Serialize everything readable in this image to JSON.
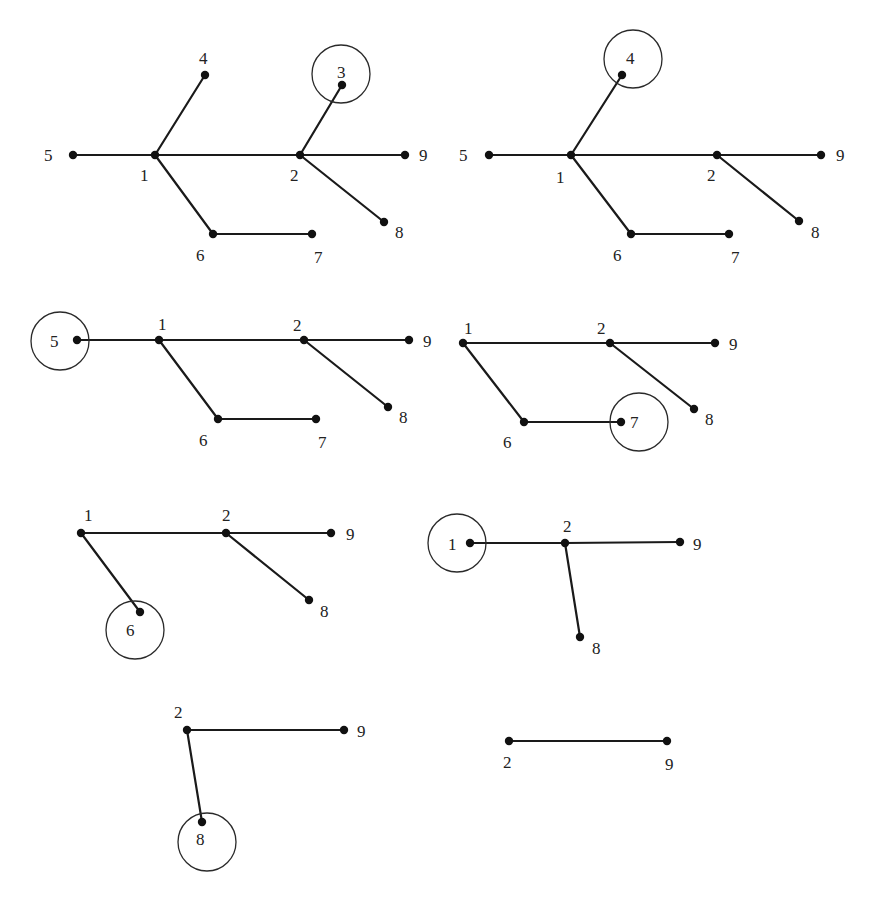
{
  "colors": {
    "background": "#ffffff",
    "edge": "#1a1a1a",
    "node": "#111111",
    "circle": "#2a2a2a",
    "label": "#222222"
  },
  "panels": [
    {
      "id": "step-1",
      "removed_leaf": "3",
      "nodes": [
        {
          "id": "5",
          "x": 73,
          "y": 155,
          "lx": 44,
          "ly": 161
        },
        {
          "id": "1",
          "x": 155,
          "y": 155,
          "lx": 140,
          "ly": 181
        },
        {
          "id": "4",
          "x": 205,
          "y": 75,
          "lx": 199,
          "ly": 64
        },
        {
          "id": "2",
          "x": 300,
          "y": 155,
          "lx": 290,
          "ly": 181
        },
        {
          "id": "3",
          "x": 342,
          "y": 85,
          "lx": 337,
          "ly": 78
        },
        {
          "id": "9",
          "x": 405,
          "y": 155,
          "lx": 419,
          "ly": 161
        },
        {
          "id": "8",
          "x": 384,
          "y": 222,
          "lx": 395,
          "ly": 238
        },
        {
          "id": "6",
          "x": 213,
          "y": 234,
          "lx": 196,
          "ly": 261
        },
        {
          "id": "7",
          "x": 312,
          "y": 234,
          "lx": 314,
          "ly": 263
        }
      ],
      "edges": [
        [
          "5",
          "1"
        ],
        [
          "1",
          "4"
        ],
        [
          "1",
          "2"
        ],
        [
          "2",
          "3"
        ],
        [
          "2",
          "9"
        ],
        [
          "2",
          "8"
        ],
        [
          "1",
          "6"
        ],
        [
          "6",
          "7"
        ]
      ],
      "circle": {
        "cx": 341,
        "cy": 74,
        "r": 29
      }
    },
    {
      "id": "step-2",
      "removed_leaf": "4",
      "nodes": [
        {
          "id": "5",
          "x": 489,
          "y": 155,
          "lx": 459,
          "ly": 161
        },
        {
          "id": "1",
          "x": 571,
          "y": 155,
          "lx": 556,
          "ly": 183
        },
        {
          "id": "4",
          "x": 622,
          "y": 75,
          "lx": 626,
          "ly": 64
        },
        {
          "id": "2",
          "x": 717,
          "y": 155,
          "lx": 707,
          "ly": 181
        },
        {
          "id": "9",
          "x": 821,
          "y": 155,
          "lx": 836,
          "ly": 161
        },
        {
          "id": "8",
          "x": 799,
          "y": 221,
          "lx": 811,
          "ly": 238
        },
        {
          "id": "6",
          "x": 631,
          "y": 234,
          "lx": 613,
          "ly": 261
        },
        {
          "id": "7",
          "x": 729,
          "y": 234,
          "lx": 731,
          "ly": 263
        }
      ],
      "edges": [
        [
          "5",
          "1"
        ],
        [
          "1",
          "4"
        ],
        [
          "1",
          "2"
        ],
        [
          "2",
          "9"
        ],
        [
          "2",
          "8"
        ],
        [
          "1",
          "6"
        ],
        [
          "6",
          "7"
        ]
      ],
      "circle": {
        "cx": 633,
        "cy": 59,
        "r": 29
      }
    },
    {
      "id": "step-3",
      "removed_leaf": "5",
      "nodes": [
        {
          "id": "5",
          "x": 77,
          "y": 340,
          "lx": 50,
          "ly": 347
        },
        {
          "id": "1",
          "x": 159,
          "y": 340,
          "lx": 158,
          "ly": 330
        },
        {
          "id": "2",
          "x": 304,
          "y": 340,
          "lx": 293,
          "ly": 331
        },
        {
          "id": "9",
          "x": 409,
          "y": 340,
          "lx": 423,
          "ly": 347
        },
        {
          "id": "8",
          "x": 388,
          "y": 407,
          "lx": 399,
          "ly": 423
        },
        {
          "id": "6",
          "x": 218,
          "y": 419,
          "lx": 199,
          "ly": 446
        },
        {
          "id": "7",
          "x": 316,
          "y": 419,
          "lx": 318,
          "ly": 448
        }
      ],
      "edges": [
        [
          "5",
          "1"
        ],
        [
          "1",
          "2"
        ],
        [
          "2",
          "9"
        ],
        [
          "2",
          "8"
        ],
        [
          "1",
          "6"
        ],
        [
          "6",
          "7"
        ]
      ],
      "circle": {
        "cx": 60,
        "cy": 341,
        "r": 29
      }
    },
    {
      "id": "step-4",
      "removed_leaf": "7",
      "nodes": [
        {
          "id": "1",
          "x": 463,
          "y": 343,
          "lx": 464,
          "ly": 334
        },
        {
          "id": "2",
          "x": 610,
          "y": 343,
          "lx": 597,
          "ly": 334
        },
        {
          "id": "9",
          "x": 715,
          "y": 343,
          "lx": 729,
          "ly": 350
        },
        {
          "id": "8",
          "x": 694,
          "y": 409,
          "lx": 705,
          "ly": 425
        },
        {
          "id": "6",
          "x": 524,
          "y": 422,
          "lx": 503,
          "ly": 448
        },
        {
          "id": "7",
          "x": 621,
          "y": 422,
          "lx": 630,
          "ly": 428
        }
      ],
      "edges": [
        [
          "1",
          "2"
        ],
        [
          "2",
          "9"
        ],
        [
          "2",
          "8"
        ],
        [
          "1",
          "6"
        ],
        [
          "6",
          "7"
        ]
      ],
      "circle": {
        "cx": 639,
        "cy": 422,
        "r": 29
      }
    },
    {
      "id": "step-5",
      "removed_leaf": "6",
      "nodes": [
        {
          "id": "1",
          "x": 81,
          "y": 533,
          "lx": 84,
          "ly": 521
        },
        {
          "id": "2",
          "x": 226,
          "y": 533,
          "lx": 222,
          "ly": 521
        },
        {
          "id": "9",
          "x": 331,
          "y": 533,
          "lx": 346,
          "ly": 540
        },
        {
          "id": "8",
          "x": 309,
          "y": 600,
          "lx": 320,
          "ly": 617
        },
        {
          "id": "6",
          "x": 140,
          "y": 612,
          "lx": 126,
          "ly": 636
        }
      ],
      "edges": [
        [
          "1",
          "2"
        ],
        [
          "2",
          "9"
        ],
        [
          "2",
          "8"
        ],
        [
          "1",
          "6"
        ]
      ],
      "circle": {
        "cx": 135,
        "cy": 630,
        "r": 29
      }
    },
    {
      "id": "step-6",
      "removed_leaf": "1",
      "nodes": [
        {
          "id": "1",
          "x": 470,
          "y": 543,
          "lx": 448,
          "ly": 550
        },
        {
          "id": "2",
          "x": 565,
          "y": 543,
          "lx": 563,
          "ly": 532
        },
        {
          "id": "9",
          "x": 680,
          "y": 542,
          "lx": 693,
          "ly": 550
        },
        {
          "id": "8",
          "x": 580,
          "y": 637,
          "lx": 592,
          "ly": 654
        }
      ],
      "edges": [
        [
          "1",
          "2"
        ],
        [
          "2",
          "9"
        ],
        [
          "2",
          "8"
        ]
      ],
      "circle": {
        "cx": 457,
        "cy": 543,
        "r": 29
      }
    },
    {
      "id": "step-7",
      "removed_leaf": "8",
      "nodes": [
        {
          "id": "2",
          "x": 187,
          "y": 730,
          "lx": 174,
          "ly": 718
        },
        {
          "id": "9",
          "x": 344,
          "y": 730,
          "lx": 357,
          "ly": 737
        },
        {
          "id": "8",
          "x": 202,
          "y": 822,
          "lx": 196,
          "ly": 845
        }
      ],
      "edges": [
        [
          "2",
          "9"
        ],
        [
          "2",
          "8"
        ]
      ],
      "circle": {
        "cx": 207,
        "cy": 842,
        "r": 29
      }
    },
    {
      "id": "step-8",
      "removed_leaf": null,
      "nodes": [
        {
          "id": "2",
          "x": 509,
          "y": 741,
          "lx": 503,
          "ly": 768
        },
        {
          "id": "9",
          "x": 667,
          "y": 741,
          "lx": 665,
          "ly": 770
        }
      ],
      "edges": [
        [
          "2",
          "9"
        ]
      ],
      "circle": null
    }
  ]
}
